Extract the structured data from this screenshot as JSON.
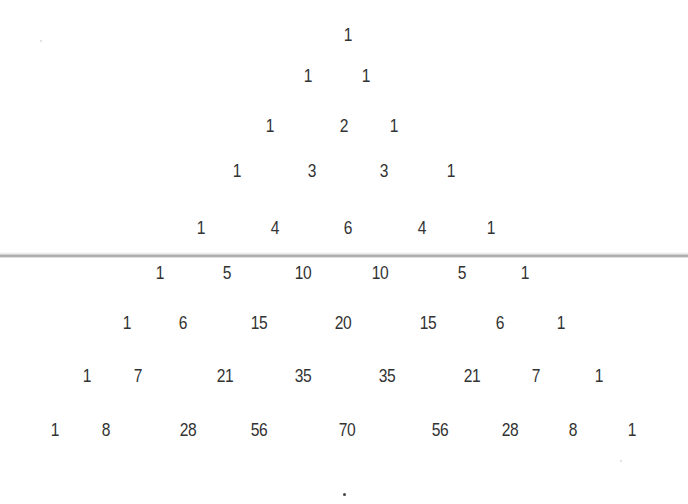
{
  "rows": [
    [
      "1"
    ],
    [
      "1",
      "1"
    ],
    [
      "1",
      "2",
      "1"
    ],
    [
      "1",
      "3",
      "3",
      "1"
    ],
    [
      "1",
      "4",
      "6",
      "4",
      "1"
    ],
    [
      "1",
      "5",
      "10",
      "10",
      "5",
      "1"
    ],
    [
      "1",
      "6",
      "15",
      "20",
      "15",
      "6",
      "1"
    ],
    [
      "1",
      "7",
      "21",
      "35",
      "35",
      "21",
      "7",
      "1"
    ],
    [
      "1",
      "8",
      "28",
      "56",
      "70",
      "56",
      "28",
      "8",
      "1"
    ]
  ],
  "footer_mark": "·"
}
